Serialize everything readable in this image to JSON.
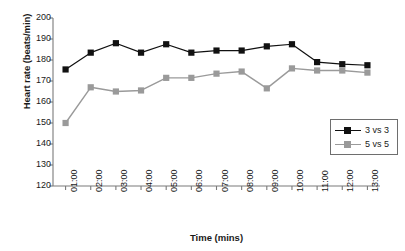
{
  "chart_data": {
    "type": "line",
    "title": "",
    "xlabel": "Time (mins)",
    "ylabel": "Heart rate (beats/min)",
    "categories": [
      "01:00",
      "02:00",
      "03:00",
      "04:00",
      "05:00",
      "06:00",
      "07:00",
      "08:00",
      "09:00",
      "10:00",
      "11:00",
      "12:00",
      "13:00"
    ],
    "x": [
      "01:00",
      "02:00",
      "03:00",
      "04:00",
      "05:00",
      "06:00",
      "07:00",
      "08:00",
      "09:00",
      "10:00",
      "11:00",
      "12:00",
      "13:00"
    ],
    "ylim": [
      120,
      200
    ],
    "yticks": [
      120,
      130,
      140,
      150,
      160,
      170,
      180,
      190,
      200
    ],
    "ytick_labels": [
      "120",
      "130",
      "140",
      "150",
      "160",
      "170",
      "180",
      "190",
      "200"
    ],
    "grid": false,
    "legend_position": "center-right",
    "series": [
      {
        "name": "3 vs 3",
        "color": "#111111",
        "marker": "square",
        "values": [
          175.5,
          183.5,
          188.0,
          183.5,
          187.5,
          183.5,
          184.5,
          184.5,
          186.5,
          187.5,
          179.0,
          178.0,
          177.5
        ]
      },
      {
        "name": "5 vs 5",
        "color": "#9a9a9a",
        "marker": "square",
        "values": [
          150.0,
          167.0,
          165.0,
          165.5,
          171.5,
          171.5,
          173.5,
          174.5,
          166.5,
          176.0,
          175.0,
          175.0,
          174.0
        ]
      }
    ]
  },
  "legend": {
    "items": [
      {
        "label": "3 vs 3"
      },
      {
        "label": "5 vs 5"
      }
    ]
  },
  "axes": {
    "x_title": "Time (mins)",
    "y_title": "Heart rate (beats/min)"
  },
  "colors": {
    "series_3v3": "#111111",
    "series_5v5": "#9a9a9a",
    "axis": "#7a7a7a",
    "text": "#1a1a1a",
    "background": "#ffffff"
  }
}
